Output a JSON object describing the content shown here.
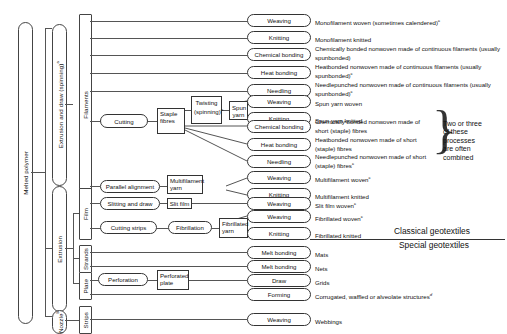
{
  "diagram": {
    "geotextiles": {
      "classical": "Classical geotextiles",
      "special": "Special geotextiles"
    },
    "brace_note": "Two or three of these processes are often combined"
  },
  "stage1": {
    "label": "Melted polymer"
  },
  "stage2": [
    {
      "key": "extrusion-draw",
      "label": "Extrusion and draw (spinning)",
      "sup": "a"
    },
    {
      "key": "extrusion",
      "label": "Extrusion",
      "sup": ""
    },
    {
      "key": "nozzle",
      "label": "Nozzle",
      "sup": "b"
    }
  ],
  "stage3": [
    {
      "key": "filaments",
      "label": "Filaments"
    },
    {
      "key": "film",
      "label": "Film"
    },
    {
      "key": "strands",
      "label": "Strands"
    },
    {
      "key": "plate",
      "label": "Plate"
    },
    {
      "key": "strips",
      "label": "Strips"
    }
  ],
  "intermediate": [
    {
      "key": "cutting",
      "label": "Cutting"
    },
    {
      "key": "staple-fibres",
      "label": "Staple fibres"
    },
    {
      "key": "twisting",
      "label": "Twisting (spinning)",
      "sup": "a"
    },
    {
      "key": "spun-yarn",
      "label": "Spun yarn"
    },
    {
      "key": "parallel-alignment",
      "label": "Parallel alignment"
    },
    {
      "key": "multifilament-yarn",
      "label": "Multifilament yarn"
    },
    {
      "key": "slitting-and-draw",
      "label": "Slitting and draw"
    },
    {
      "key": "slit-film",
      "label": "Slit film"
    },
    {
      "key": "cutting-strips",
      "label": "Cutting strips"
    },
    {
      "key": "fibrillation",
      "label": "Fibrillation"
    },
    {
      "key": "fibrillated-yarn",
      "label": "Fibrillated yarn"
    },
    {
      "key": "perforation",
      "label": "Perforation"
    },
    {
      "key": "perforated-plate",
      "label": "Perforated plate"
    }
  ],
  "rows": [
    {
      "process": "Weaving",
      "product": "Monofilament woven (sometimes calendered)",
      "sup": "c"
    },
    {
      "process": "Knitting",
      "product": "Monofilament knitted",
      "sup": ""
    },
    {
      "process": "Chemical bonding",
      "product": "Chemically bonded nonwoven made of continuous filaments (usually spunbonded)",
      "sup": ""
    },
    {
      "process": "Heat bonding",
      "product": "Heatbonded nonwoven made of continuous filaments (usually spunbonded)",
      "sup": "c"
    },
    {
      "process": "Needling",
      "product": "Needlepunched nonwoven made of continuous filaments (usually spunbonded)",
      "sup": "c"
    },
    {
      "process": "Weaving",
      "product": "Spun yarn woven",
      "sup": ""
    },
    {
      "process": "Knitting",
      "product": "Spun yarn knitted",
      "sup": ""
    },
    {
      "process": "Chemical bonding",
      "product": "Chemically bonded nonwoven made of short (staple) fibres",
      "sup": ""
    },
    {
      "process": "Heat bonding",
      "product": "Heatbonded nonwoven made of short (staple) fibres",
      "sup": ""
    },
    {
      "process": "Needling",
      "product": "Needlepunched nonwoven made of short (staple) fibres",
      "sup": "c"
    },
    {
      "process": "Weaving",
      "product": "Multifilament woven",
      "sup": "c"
    },
    {
      "process": "Knitting",
      "product": "Multifilament knitted",
      "sup": ""
    },
    {
      "process": "Weaving",
      "product": "Slit film woven",
      "sup": "c"
    },
    {
      "process": "Weaving",
      "product": "Fibrillated woven",
      "sup": "c"
    },
    {
      "process": "Knitting",
      "product": "Fibrillated knitted",
      "sup": ""
    },
    {
      "process": "Melt bonding",
      "product": "Mats",
      "sup": ""
    },
    {
      "process": "Melt bonding",
      "product": "Nets",
      "sup": ""
    },
    {
      "process": "Draw",
      "product": "Grids",
      "sup": ""
    },
    {
      "process": "Forming",
      "product": "Corrugated, waffled or alveolate structures",
      "sup": "d"
    },
    {
      "process": "Weaving",
      "product": "Webbings",
      "sup": ""
    }
  ]
}
